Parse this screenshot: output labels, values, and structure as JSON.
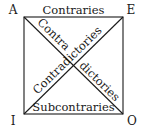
{
  "corners": {
    "top_left": "A",
    "top_right": "E",
    "bottom_left": "I",
    "bottom_right": "O"
  },
  "relations": {
    "top": "Contraries",
    "bottom": "Subcontraries",
    "diagonal_ao_part1": "Contra",
    "diagonal_ao_part2": "dictories",
    "diagonal_ie": "Contradictories"
  },
  "colors": {
    "line": "#1a1a1a",
    "text": "#1a1a1a",
    "background": "#ffffff"
  }
}
